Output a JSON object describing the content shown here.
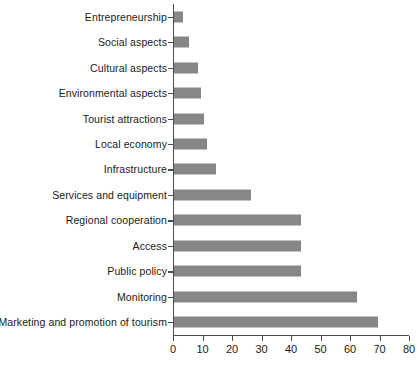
{
  "chart_data": {
    "type": "bar",
    "orientation": "horizontal",
    "title": "",
    "subtitle": "",
    "xlabel": "",
    "ylabel": "",
    "xlim": [
      0,
      80
    ],
    "xticks": [
      0,
      10,
      20,
      30,
      40,
      50,
      60,
      70,
      80
    ],
    "grid": false,
    "legend": false,
    "bar_color": "#878787",
    "axis_color": "#4d4d4d",
    "categories": [
      "Entrepreneurship",
      "Social aspects",
      "Cultural aspects",
      "Environmental aspects",
      "Tourist attractions",
      "Local economy",
      "Infrastructure",
      "Services and equipment",
      "Regional cooperation",
      "Access",
      "Public policy",
      "Monitoring",
      "Marketing and promotion of tourism"
    ],
    "values": [
      3,
      5,
      8,
      9,
      10,
      11,
      14,
      26,
      43,
      43,
      43,
      62,
      69
    ]
  }
}
